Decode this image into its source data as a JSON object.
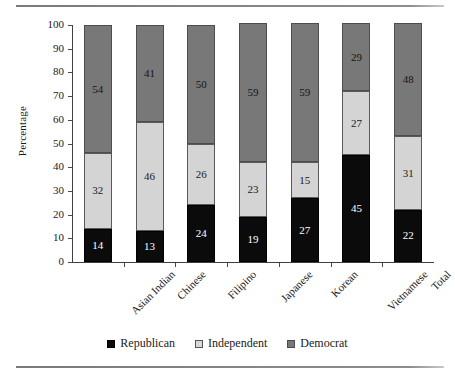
{
  "chart_data": {
    "type": "bar",
    "subtype": "stacked-bar-100-percent",
    "title": "",
    "xlabel": "",
    "ylabel": "Percentage",
    "ylim": [
      0,
      100
    ],
    "ytick_step": 10,
    "yticks": [
      100,
      90,
      80,
      70,
      60,
      50,
      40,
      30,
      20,
      10,
      0
    ],
    "grid": false,
    "legend_position": "bottom-center",
    "categories": [
      "Asian Indian",
      "Chinese",
      "Filipino",
      "Japanese",
      "Korean",
      "Vietnamese",
      "Total"
    ],
    "series": [
      {
        "name": "Republican",
        "color": "#0b0b0b",
        "values": [
          14,
          13,
          24,
          19,
          27,
          45,
          22
        ]
      },
      {
        "name": "Independent",
        "color": "#d4d4d4",
        "values": [
          32,
          46,
          26,
          23,
          15,
          27,
          31
        ]
      },
      {
        "name": "Democrat",
        "color": "#787878",
        "values": [
          54,
          41,
          50,
          59,
          59,
          29,
          48
        ]
      }
    ]
  },
  "legend": {
    "items": [
      {
        "label": "Republican",
        "swatch": "republican-swatch"
      },
      {
        "label": "Independent",
        "swatch": "independent-swatch"
      },
      {
        "label": "Democrat",
        "swatch": "democrat-swatch"
      }
    ]
  },
  "axis": {
    "y_title": "Percentage"
  }
}
